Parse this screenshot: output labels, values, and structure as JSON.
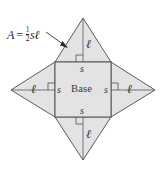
{
  "figure": {
    "kind": "square-pyramid-net",
    "colors": {
      "face_fill": "#e3e3e3",
      "face_stroke": "#4a4a4a",
      "text": "#2e2e2e",
      "leader": "#2b2b2b",
      "background": "#ffffff"
    }
  },
  "formula": {
    "lhs": "A",
    "equals": "=",
    "fraction_numerator": "1",
    "fraction_denominator": "2",
    "factor_s": "s",
    "factor_ell": "ℓ",
    "full_text": "A = 1/2 sℓ"
  },
  "base": {
    "label": "Base",
    "side_labels": {
      "top": "s",
      "bottom": "s",
      "left": "s",
      "right": "s"
    }
  },
  "triangles": [
    {
      "position": "top",
      "slant_label": "ℓ",
      "base_label": "s",
      "has_right_angle_marker": true
    },
    {
      "position": "right",
      "slant_label": "ℓ",
      "base_label": "s",
      "has_right_angle_marker": true
    },
    {
      "position": "bottom",
      "slant_label": "ℓ",
      "base_label": "s",
      "has_right_angle_marker": true
    },
    {
      "position": "left",
      "slant_label": "ℓ",
      "base_label": "s",
      "has_right_angle_marker": true
    }
  ],
  "geometry": {
    "square": {
      "left": 55,
      "top": 62,
      "right": 111,
      "bottom": 117
    },
    "apexes": {
      "top": {
        "x": 83,
        "y": 18
      },
      "right": {
        "x": 155,
        "y": 90
      },
      "bottom": {
        "x": 83,
        "y": 160
      },
      "left": {
        "x": 11,
        "y": 90
      }
    }
  }
}
